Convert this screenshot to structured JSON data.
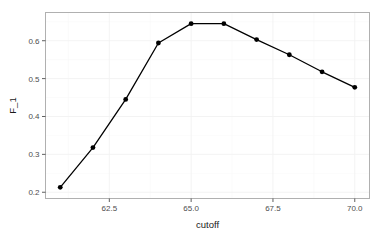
{
  "chart_data": {
    "type": "line",
    "title": "",
    "xlabel": "cutoff",
    "ylabel": "F_1",
    "x": [
      61,
      62,
      63,
      64,
      65,
      66,
      67,
      68,
      69,
      70
    ],
    "values": [
      0.213,
      0.318,
      0.445,
      0.594,
      0.645,
      0.645,
      0.603,
      0.563,
      0.518,
      0.477
    ],
    "series": [
      {
        "name": "F_1",
        "values": [
          0.213,
          0.318,
          0.445,
          0.594,
          0.645,
          0.645,
          0.603,
          0.563,
          0.518,
          0.477
        ]
      }
    ],
    "xlim": [
      60.55,
      70.45
    ],
    "ylim": [
      0.1835,
      0.6745
    ],
    "xticks": [
      62.5,
      65.0,
      67.5,
      70.0
    ],
    "xtick_labels": [
      "62.5",
      "65.0",
      "67.5",
      "70.0"
    ],
    "yticks": [
      0.2,
      0.3,
      0.4,
      0.5,
      0.6
    ],
    "ytick_labels": [
      "0.2",
      "0.3",
      "0.4",
      "0.5",
      "0.6"
    ],
    "x_minor_ticks": [
      61.25,
      63.75,
      66.25,
      68.75
    ],
    "y_minor_ticks": [
      0.25,
      0.35,
      0.45,
      0.55,
      0.65
    ],
    "grid": true,
    "legend": "none",
    "marker": "filled-circle",
    "line_color": "#000000",
    "point_color": "#000000",
    "panel_background": "#ffffff",
    "grid_color": "#f2f2f2",
    "border_color": "#b0b0b0"
  }
}
